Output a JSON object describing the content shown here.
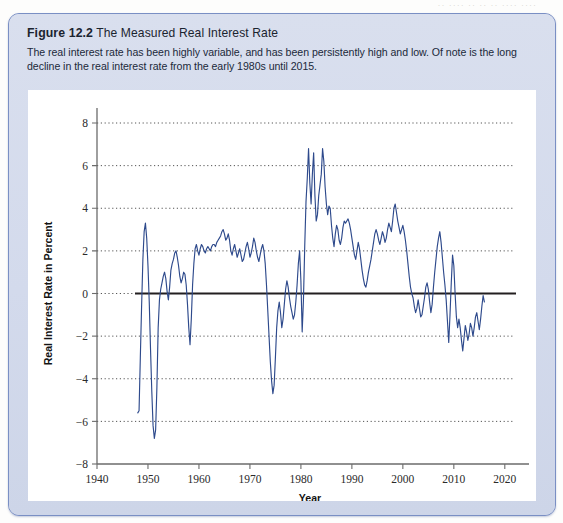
{
  "bleed_text": "·· ···· ·· ·· ·· ···· ····",
  "figure": {
    "number": "Figure 12.2",
    "title": "The Measured Real Interest Rate",
    "caption": "The real interest rate has been highly variable, and has been persistently high and low. Of note is the long decline in the real interest rate from the early 1980s until 2015."
  },
  "colors": {
    "panel_bg": "#d5dced",
    "panel_border": "#7a8fc4",
    "plot_bg": "#ffffff",
    "series_line": "#2e4a8c",
    "zero_line": "#231f20",
    "grid": "#555555",
    "axis": "#6b6b6b"
  },
  "chart_data": {
    "type": "line",
    "title": "The Measured Real Interest Rate",
    "xlabel": "Year",
    "ylabel": "Real Interest Rate in Percent",
    "xlim": [
      1940,
      2022
    ],
    "ylim": [
      -8,
      8
    ],
    "xticks": [
      1940,
      1950,
      1960,
      1970,
      1980,
      1990,
      2000,
      2010,
      2020
    ],
    "yticks": [
      -8,
      -6,
      -4,
      -2,
      0,
      2,
      4,
      6,
      8
    ],
    "grid": "horizontal-dotted",
    "legend": "none",
    "zero_reference_line": 0,
    "series": [
      {
        "name": "Real Interest Rate",
        "x": [
          1948.0,
          1948.25,
          1948.5,
          1948.75,
          1949.0,
          1949.25,
          1949.5,
          1949.75,
          1950.0,
          1950.25,
          1950.5,
          1950.75,
          1951.0,
          1951.25,
          1951.5,
          1951.75,
          1952.0,
          1952.25,
          1952.5,
          1952.75,
          1953.0,
          1953.25,
          1953.5,
          1953.75,
          1954.0,
          1954.25,
          1954.5,
          1954.75,
          1955.0,
          1955.25,
          1955.5,
          1955.75,
          1956.0,
          1956.25,
          1956.5,
          1956.75,
          1957.0,
          1957.25,
          1957.5,
          1957.75,
          1958.0,
          1958.25,
          1958.5,
          1958.75,
          1959.0,
          1959.25,
          1959.5,
          1959.75,
          1960.0,
          1960.25,
          1960.5,
          1960.75,
          1961.0,
          1961.25,
          1961.5,
          1961.75,
          1962.0,
          1962.25,
          1962.5,
          1962.75,
          1963.0,
          1963.25,
          1963.5,
          1963.75,
          1964.0,
          1964.25,
          1964.5,
          1964.75,
          1965.0,
          1965.25,
          1965.5,
          1965.75,
          1966.0,
          1966.25,
          1966.5,
          1966.75,
          1967.0,
          1967.25,
          1967.5,
          1967.75,
          1968.0,
          1968.25,
          1968.5,
          1968.75,
          1969.0,
          1969.25,
          1969.5,
          1969.75,
          1970.0,
          1970.25,
          1970.5,
          1970.75,
          1971.0,
          1971.25,
          1971.5,
          1971.75,
          1972.0,
          1972.25,
          1972.5,
          1972.75,
          1973.0,
          1973.25,
          1973.5,
          1973.75,
          1974.0,
          1974.25,
          1974.5,
          1974.75,
          1975.0,
          1975.25,
          1975.5,
          1975.75,
          1976.0,
          1976.25,
          1976.5,
          1976.75,
          1977.0,
          1977.25,
          1977.5,
          1977.75,
          1978.0,
          1978.25,
          1978.5,
          1978.75,
          1979.0,
          1979.25,
          1979.5,
          1979.75,
          1980.0,
          1980.25,
          1980.5,
          1980.75,
          1981.0,
          1981.25,
          1981.5,
          1981.75,
          1982.0,
          1982.25,
          1982.5,
          1982.75,
          1983.0,
          1983.25,
          1983.5,
          1983.75,
          1984.0,
          1984.25,
          1984.5,
          1984.75,
          1985.0,
          1985.25,
          1985.5,
          1985.75,
          1986.0,
          1986.25,
          1986.5,
          1986.75,
          1987.0,
          1987.25,
          1987.5,
          1987.75,
          1988.0,
          1988.25,
          1988.5,
          1988.75,
          1989.0,
          1989.25,
          1989.5,
          1989.75,
          1990.0,
          1990.25,
          1990.5,
          1990.75,
          1991.0,
          1991.25,
          1991.5,
          1991.75,
          1992.0,
          1992.25,
          1992.5,
          1992.75,
          1993.0,
          1993.25,
          1993.5,
          1993.75,
          1994.0,
          1994.25,
          1994.5,
          1994.75,
          1995.0,
          1995.25,
          1995.5,
          1995.75,
          1996.0,
          1996.25,
          1996.5,
          1996.75,
          1997.0,
          1997.25,
          1997.5,
          1997.75,
          1998.0,
          1998.25,
          1998.5,
          1998.75,
          1999.0,
          1999.25,
          1999.5,
          1999.75,
          2000.0,
          2000.25,
          2000.5,
          2000.75,
          2001.0,
          2001.25,
          2001.5,
          2001.75,
          2002.0,
          2002.25,
          2002.5,
          2002.75,
          2003.0,
          2003.25,
          2003.5,
          2003.75,
          2004.0,
          2004.25,
          2004.5,
          2004.75,
          2005.0,
          2005.25,
          2005.5,
          2005.75,
          2006.0,
          2006.25,
          2006.5,
          2006.75,
          2007.0,
          2007.25,
          2007.5,
          2007.75,
          2008.0,
          2008.25,
          2008.5,
          2008.75,
          2009.0,
          2009.25,
          2009.5,
          2009.75,
          2010.0,
          2010.25,
          2010.5,
          2010.75,
          2011.0,
          2011.25,
          2011.5,
          2011.75,
          2012.0,
          2012.25,
          2012.5,
          2012.75,
          2013.0,
          2013.25,
          2013.5,
          2013.75,
          2014.0,
          2014.25,
          2014.5,
          2014.75,
          2015.0,
          2015.25,
          2015.5,
          2015.75,
          2016.0
        ],
        "y": [
          -5.6,
          -5.5,
          -3.0,
          -0.6,
          1.6,
          2.9,
          3.3,
          2.6,
          1.3,
          -0.4,
          -2.6,
          -4.6,
          -6.2,
          -6.8,
          -6.4,
          -4.4,
          -1.6,
          -0.3,
          0.2,
          0.5,
          0.8,
          1.0,
          0.7,
          0.1,
          -0.3,
          0.3,
          1.1,
          1.4,
          1.6,
          1.9,
          2.0,
          1.7,
          1.3,
          0.8,
          0.5,
          0.7,
          1.0,
          0.9,
          0.4,
          -0.5,
          -1.6,
          -2.4,
          -1.2,
          0.4,
          1.4,
          2.1,
          2.3,
          2.0,
          1.8,
          2.1,
          2.3,
          2.2,
          2.0,
          1.9,
          2.1,
          2.2,
          2.1,
          2.0,
          2.2,
          2.3,
          2.3,
          2.2,
          2.4,
          2.5,
          2.6,
          2.7,
          2.9,
          3.0,
          2.8,
          2.5,
          2.6,
          2.8,
          2.5,
          2.0,
          1.8,
          2.1,
          2.3,
          2.0,
          1.7,
          1.9,
          2.1,
          1.8,
          1.5,
          1.6,
          1.9,
          2.2,
          2.4,
          2.1,
          1.7,
          1.9,
          2.2,
          2.6,
          2.4,
          2.0,
          1.7,
          1.5,
          1.8,
          2.1,
          2.3,
          2.0,
          1.4,
          0.4,
          -0.8,
          -2.0,
          -3.2,
          -4.1,
          -4.7,
          -4.3,
          -3.0,
          -1.6,
          -0.8,
          -0.4,
          -0.9,
          -1.6,
          -1.2,
          -0.5,
          0.2,
          0.6,
          0.3,
          -0.2,
          -0.6,
          -0.9,
          -1.2,
          -1.0,
          -0.4,
          0.4,
          1.4,
          2.0,
          0.6,
          -1.8,
          -0.3,
          2.2,
          4.3,
          5.4,
          6.8,
          5.2,
          4.2,
          5.6,
          6.6,
          4.6,
          3.4,
          3.7,
          4.6,
          5.1,
          5.6,
          6.8,
          6.2,
          5.0,
          4.2,
          3.7,
          4.1,
          4.0,
          3.2,
          2.6,
          2.2,
          2.8,
          3.2,
          3.0,
          2.5,
          2.3,
          2.6,
          3.1,
          3.4,
          3.3,
          3.4,
          3.5,
          3.3,
          3.0,
          2.6,
          2.2,
          1.8,
          1.6,
          2.0,
          2.4,
          2.1,
          1.6,
          1.1,
          0.7,
          0.4,
          0.3,
          0.6,
          1.0,
          1.3,
          1.6,
          2.0,
          2.4,
          2.8,
          3.0,
          2.8,
          2.5,
          2.3,
          2.6,
          2.9,
          2.7,
          2.4,
          2.6,
          3.0,
          3.3,
          3.1,
          2.9,
          3.4,
          4.0,
          4.2,
          3.8,
          3.4,
          3.1,
          2.8,
          3.0,
          3.2,
          2.9,
          2.5,
          2.0,
          1.4,
          0.8,
          0.3,
          0.0,
          -0.2,
          -0.6,
          -0.9,
          -0.7,
          -0.3,
          -0.7,
          -1.1,
          -1.0,
          -0.6,
          -0.2,
          0.3,
          0.5,
          0.2,
          -0.4,
          -0.9,
          -0.5,
          0.3,
          1.0,
          1.6,
          2.2,
          2.6,
          2.9,
          2.4,
          1.7,
          1.0,
          0.4,
          -0.3,
          -1.3,
          -2.3,
          -1.0,
          0.5,
          1.8,
          1.3,
          0.0,
          -1.1,
          -1.6,
          -1.2,
          -1.6,
          -2.2,
          -2.7,
          -2.1,
          -1.5,
          -1.8,
          -2.2,
          -1.9,
          -1.4,
          -1.6,
          -2.0,
          -1.6,
          -1.1,
          -0.9,
          -1.3,
          -1.7,
          -1.2,
          -0.6,
          -0.1,
          -0.4
        ]
      }
    ],
    "annotations": {
      "notable_low_1951": -6.8,
      "notable_low_1975": -4.7,
      "notable_high_1981": 6.8,
      "notable_high_1984": 6.8,
      "series_start_year": 1948,
      "series_end_year": 2016
    }
  },
  "axis_titles": {
    "x": "Year",
    "y": "Real Interest Rate in Percent"
  }
}
